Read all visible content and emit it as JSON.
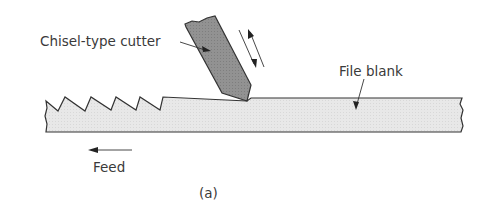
{
  "figure": {
    "labels": {
      "cutter": "Chisel-type cutter",
      "blank": "File blank",
      "feed": "Feed",
      "caption": "(a)"
    },
    "colors": {
      "cutter_fill": "#8f8f8f",
      "blank_fill": "#e6e6e6",
      "stroke": "#333333",
      "text": "#3a3a3a"
    }
  }
}
